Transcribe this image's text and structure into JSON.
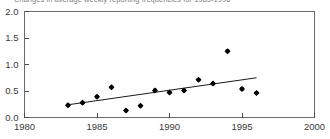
{
  "chart_data": {
    "type": "scatter",
    "title": "Changes in average weekly reporting frequencies for 1983-1996",
    "xlabel": "",
    "ylabel": "",
    "grid": false,
    "legend": "none",
    "xlim": [
      1980,
      2000
    ],
    "ylim": [
      0.0,
      2.0
    ],
    "xticks": [
      1980,
      1985,
      1990,
      1995,
      2000
    ],
    "xtick_labels": [
      "1980",
      "1985",
      "1990",
      "1995",
      "2000"
    ],
    "yticks": [
      0.0,
      0.5,
      1.0,
      1.5,
      2.0
    ],
    "ytick_labels": [
      "0.0",
      "0.5",
      "1.0",
      "1.5",
      "2.0"
    ],
    "marker": "filled-diamond",
    "marker_color": "#000000",
    "x": [
      1983,
      1984,
      1985,
      1986,
      1987,
      1988,
      1989,
      1990,
      1991,
      1992,
      1993,
      1994,
      1995,
      1996
    ],
    "y": [
      0.23,
      0.28,
      0.39,
      0.57,
      0.13,
      0.22,
      0.51,
      0.47,
      0.51,
      0.71,
      0.64,
      1.25,
      0.54,
      0.46
    ],
    "series": [
      {
        "name": "Observed change",
        "type": "scatter",
        "values": [
          0.23,
          0.28,
          0.39,
          0.57,
          0.13,
          0.22,
          0.51,
          0.47,
          0.51,
          0.71,
          0.64,
          1.25,
          0.54,
          0.46
        ]
      },
      {
        "name": "Linear trend",
        "type": "line",
        "x": [
          1983,
          1996
        ],
        "values": [
          0.24,
          0.75
        ]
      }
    ],
    "trend_line": {
      "x_start": 1983,
      "y_start": 0.24,
      "x_end": 1996,
      "y_end": 0.75,
      "color": "#000000"
    }
  },
  "axis": {
    "frame_color": "#6b6b6b",
    "tick_color": "#4a4a4a"
  }
}
